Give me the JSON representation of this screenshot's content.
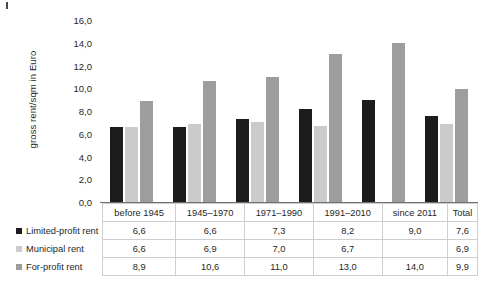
{
  "chart_data": {
    "type": "bar",
    "title": "",
    "xlabel": "",
    "ylabel": "gross rent/sqm in Euro",
    "ylim": [
      0,
      16
    ],
    "ytick_step": 2,
    "ytick_labels": [
      "16,0",
      "14,0",
      "12,0",
      "10,0",
      "8,0",
      "6,0",
      "4,0",
      "2,0",
      "0,0"
    ],
    "grid": false,
    "legend_position": "table-left",
    "categories": [
      "before 1945",
      "1945–1970",
      "1971–1990",
      "1991–2010",
      "since 2011",
      "Total"
    ],
    "series": [
      {
        "name": "Limited-profit rent",
        "color": "#1c1c1c",
        "values": [
          6.6,
          6.6,
          7.3,
          8.2,
          9.0,
          7.6
        ],
        "labels": [
          "6,6",
          "6,6",
          "7,3",
          "8,2",
          "9,0",
          "7,6"
        ]
      },
      {
        "name": "Municipal rent",
        "color": "#cbcbcb",
        "values": [
          6.6,
          6.9,
          7.0,
          6.7,
          null,
          6.9
        ],
        "labels": [
          "6,6",
          "6,9",
          "7,0",
          "6,7",
          "",
          "6,9"
        ]
      },
      {
        "name": "For-profit rent",
        "color": "#9d9d9d",
        "values": [
          8.9,
          10.6,
          11.0,
          13.0,
          14.0,
          9.9
        ],
        "labels": [
          "8,9",
          "10,6",
          "11,0",
          "13,0",
          "14,0",
          "9,9"
        ]
      }
    ]
  }
}
